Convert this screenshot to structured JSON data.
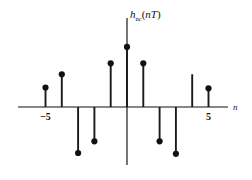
{
  "figure": {
    "title": "",
    "y_axis_label": "h_nc(nT)",
    "y_axis_label_parts": {
      "base": "h",
      "subscript": "nc",
      "argument": "nT",
      "open_paren": "(",
      "close_paren": ")"
    },
    "x_axis_label": "n"
  },
  "chart_data": {
    "type": "bar",
    "title": "",
    "subtitle": "",
    "xlabel": "n",
    "ylabel": "h_nc(nT)",
    "grid": false,
    "legend": null,
    "style": "stem",
    "xlim": [
      -6.5,
      6.5
    ],
    "ylim": [
      -3.1,
      4.0
    ],
    "xticks": [
      -5,
      5
    ],
    "xticklabels": [
      "−5",
      "5"
    ],
    "yticks": [],
    "yticklabels": [],
    "categories": [
      -5,
      -4,
      -3,
      -2,
      -1,
      0,
      1,
      2,
      3,
      4,
      5,
      6
    ],
    "x": [
      -5,
      -4,
      -3,
      -2,
      -1,
      0,
      1,
      2,
      3,
      4,
      5,
      6
    ],
    "values": [
      1.25,
      2.1,
      -2.95,
      -2.2,
      2.8,
      3.85,
      2.8,
      -2.2,
      -3.0,
      2.1,
      1.2,
      0
    ],
    "markers": [
      true,
      true,
      true,
      true,
      true,
      true,
      true,
      true,
      true,
      false,
      true,
      false
    ],
    "annotations": []
  },
  "geometry": {
    "x_axis_y": 107,
    "y_axis_x": 127,
    "x_axis_start": 18,
    "x_axis_end": 228,
    "y_axis_top": 18,
    "y_axis_bottom": 165,
    "step_px": 16.3,
    "dot_radius": 3.1
  },
  "colors": {
    "background": "#ffffff",
    "ink": "#111111",
    "stem": "#1a1a1a"
  }
}
